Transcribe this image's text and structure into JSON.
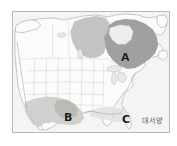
{
  "figure": {
    "kind": "reference-map",
    "frame": {
      "border_color": "#b9b9b9",
      "background_color": "#ffffff"
    }
  },
  "map": {
    "ocean_color": "#f4f4f2",
    "land_color": "#fbfbfa",
    "coastline_color": "#9a9a9a",
    "border_line_color": "#c4c4c4",
    "lake_color": "#e9e9e7",
    "shaded_regions": [
      {
        "label": "A",
        "description": "dark gray shaded area over eastern Canada / Canadian Shield",
        "fill_color": "#9b9b9b"
      },
      {
        "label": "A-secondary",
        "description": "medium gray shaded area over central and northwestern Canada",
        "fill_color": "#bdbdbd"
      },
      {
        "label": "B",
        "description": "gray shaded area over the southwestern United States and northern Mexico",
        "fill_color": "#c9c9c7"
      },
      {
        "label": "C",
        "description": "light shaded area along the southeastern United States and Gulf coast",
        "fill_color": "#dedede"
      }
    ]
  },
  "labels": {
    "a": "A",
    "b": "B",
    "c": "C",
    "ocean": "대서양"
  }
}
